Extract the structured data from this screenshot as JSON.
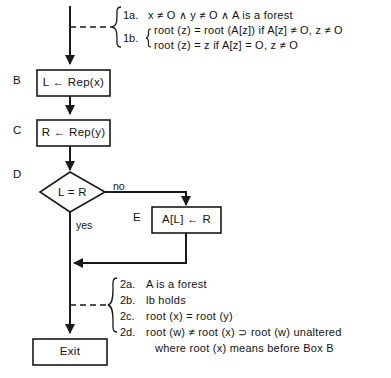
{
  "diagram": {
    "nodes": [
      {
        "id": "B",
        "step": "B",
        "text": "L ← Rep(x)",
        "shape": "process"
      },
      {
        "id": "C",
        "step": "C",
        "text": "R ← Rep(y)",
        "shape": "process"
      },
      {
        "id": "D",
        "step": "D",
        "text": "L = R",
        "shape": "decision"
      },
      {
        "id": "E",
        "step": "E",
        "text": "A[L] ← R",
        "shape": "process"
      },
      {
        "id": "Exit",
        "step": "",
        "text": "Exit",
        "shape": "terminal"
      }
    ],
    "edge_labels": {
      "no": "no",
      "yes": "yes"
    },
    "assertion_top": {
      "tag_a": "1a.",
      "tag_b": "1b.",
      "line_a": "x ≠ O ∧ y ≠ O ∧ A  is  a  forest",
      "line_b1": "root (z) = root (A[z])  if  A[z] ≠ O,  z ≠ O",
      "line_b2": "root (z) = z                  if  A[z] = O,  z ≠ O"
    },
    "assertion_bottom": {
      "tag_a": "2a.",
      "tag_b": "2b.",
      "tag_c": "2c.",
      "tag_d": "2d.",
      "line_a": "A  is  a  forest",
      "line_b": "lb  holds",
      "line_c": "root (x) = root (y)",
      "line_d": "root (w) ≠ root (x) ⊃ root (w)  unaltered",
      "line_d_cont": "where root (x) means before Box B"
    },
    "colors": {
      "stroke": "#1a1a1a",
      "background": "#ffffff"
    }
  }
}
